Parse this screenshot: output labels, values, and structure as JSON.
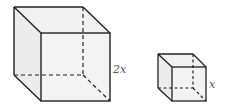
{
  "figure": {
    "large_cube": {
      "edge_label": "2x",
      "face_fill": "#eeeeee",
      "edge_color": "#222222"
    },
    "small_cube": {
      "edge_label": "x",
      "face_fill": "#eeeeee",
      "edge_color": "#222222"
    }
  }
}
